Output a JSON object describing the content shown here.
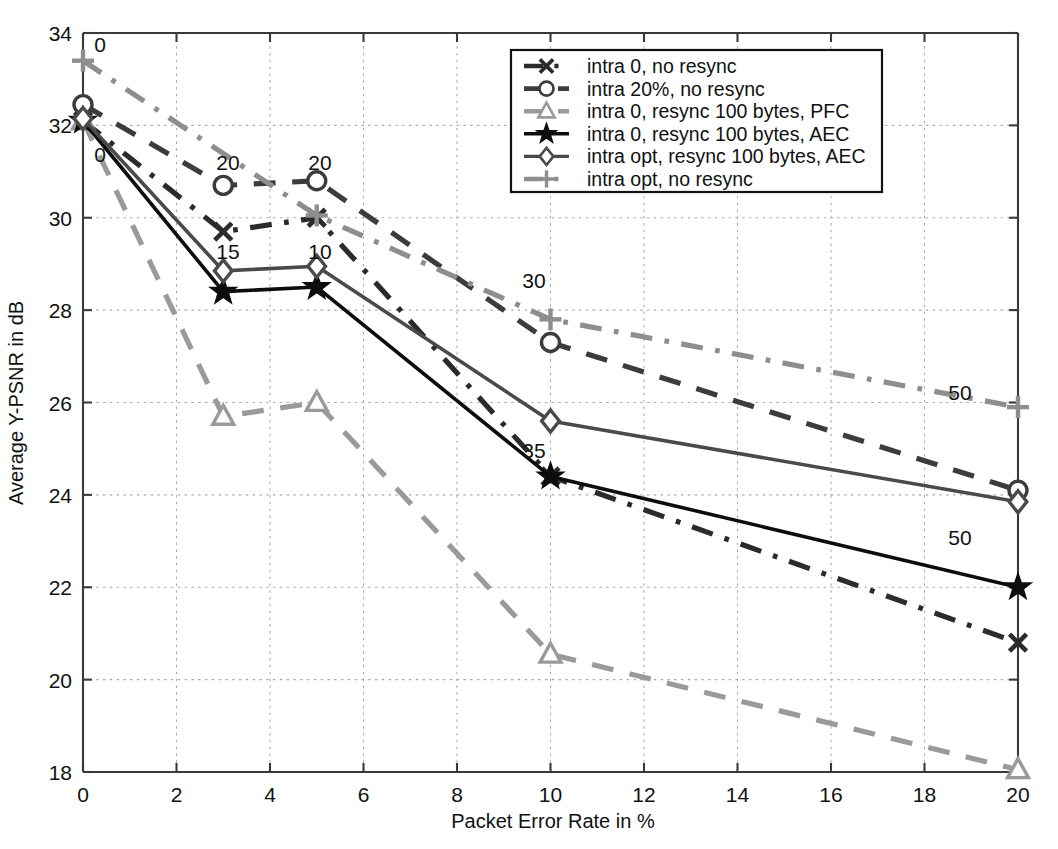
{
  "chart_data": {
    "type": "line",
    "title": "",
    "xlabel": "Packet Error Rate in %",
    "ylabel": "Average Y-PSNR in dB",
    "xlim": [
      0,
      20
    ],
    "ylim": [
      18,
      34
    ],
    "xticks": [
      0,
      2,
      4,
      6,
      8,
      10,
      12,
      14,
      16,
      18,
      20
    ],
    "yticks": [
      18,
      20,
      22,
      24,
      26,
      28,
      30,
      32,
      34
    ],
    "grid": true,
    "legend_position": "top-right",
    "series": [
      {
        "name": "intra 0, no resync",
        "marker": "x",
        "color": "#2b2b2b",
        "linestyle": "dashdot",
        "x": [
          0,
          3,
          5,
          10,
          20
        ],
        "values": [
          32.1,
          29.7,
          30.0,
          24.4,
          20.8
        ],
        "point_labels": [
          "",
          "",
          "",
          "",
          ""
        ]
      },
      {
        "name": "intra 20%, no resync",
        "marker": "circle",
        "color": "#3c3c3c",
        "linestyle": "dashed",
        "x": [
          0,
          3,
          5,
          10,
          20
        ],
        "values": [
          32.45,
          30.7,
          30.8,
          27.3,
          24.1
        ],
        "point_labels": [
          "0",
          "20",
          "20",
          "",
          ""
        ]
      },
      {
        "name": "intra 0, resync 100 bytes, PFC",
        "marker": "triangle",
        "color": "#9a9a9a",
        "linestyle": "dashed",
        "x": [
          0,
          3,
          5,
          10,
          20
        ],
        "values": [
          32.1,
          25.7,
          26.0,
          20.55,
          18.05
        ],
        "point_labels": [
          "",
          "",
          "",
          "",
          ""
        ]
      },
      {
        "name": "intra 0, resync 100 bytes, AEC",
        "marker": "star",
        "color": "#0d0d0d",
        "linestyle": "solid",
        "x": [
          0,
          3,
          5,
          10,
          20
        ],
        "values": [
          32.1,
          28.4,
          28.5,
          24.4,
          22.0
        ],
        "point_labels": [
          "",
          "",
          "",
          "35",
          ""
        ]
      },
      {
        "name": "intra opt, resync 100 bytes, AEC",
        "marker": "diamond",
        "color": "#4a4a4a",
        "linestyle": "solid",
        "x": [
          0,
          3,
          5,
          10,
          20
        ],
        "values": [
          32.15,
          28.85,
          28.95,
          25.6,
          23.85
        ],
        "point_labels": [
          "",
          "15",
          "10",
          "",
          "50"
        ]
      },
      {
        "name": "intra opt, no resync",
        "marker": "plus",
        "color": "#8e8e8e",
        "linestyle": "dashdot",
        "x": [
          0,
          5,
          10,
          20
        ],
        "values": [
          33.4,
          30.05,
          27.8,
          25.9
        ],
        "point_labels": [
          "0",
          "",
          "30",
          "50"
        ]
      }
    ]
  },
  "legend": {
    "items": [
      "intra 0, no resync",
      "intra 20%, no resync",
      "intra 0, resync 100 bytes, PFC",
      "intra 0, resync 100 bytes, AEC",
      "intra opt, resync 100 bytes, AEC",
      "intra opt, no resync"
    ]
  },
  "axes": {
    "x_title": "Packet Error Rate in %",
    "y_title": "Average Y-PSNR in dB",
    "x_tick_labels": [
      "0",
      "2",
      "4",
      "6",
      "8",
      "10",
      "12",
      "14",
      "16",
      "18",
      "20"
    ],
    "y_tick_labels": [
      "18",
      "20",
      "22",
      "24",
      "26",
      "28",
      "30",
      "32",
      "34"
    ]
  },
  "annotations": [
    {
      "text": "0",
      "x": 100,
      "y": 52
    },
    {
      "text": "0",
      "x": 100,
      "y": 162
    },
    {
      "text": "20",
      "x": 228,
      "y": 170
    },
    {
      "text": "20",
      "x": 320,
      "y": 170
    },
    {
      "text": "15",
      "x": 228,
      "y": 259
    },
    {
      "text": "10",
      "x": 320,
      "y": 259
    },
    {
      "text": "30",
      "x": 534,
      "y": 288
    },
    {
      "text": "35",
      "x": 534,
      "y": 458
    },
    {
      "text": "50",
      "x": 960,
      "y": 400
    },
    {
      "text": "50",
      "x": 960,
      "y": 545
    }
  ],
  "colors": {
    "grid": "#aaaaaa",
    "axis": "#3a3a3a",
    "black": "#0d0d0d",
    "dark_gray": "#3c3c3c",
    "mid_gray": "#4a4a4a",
    "light_gray": "#9a9a9a"
  }
}
